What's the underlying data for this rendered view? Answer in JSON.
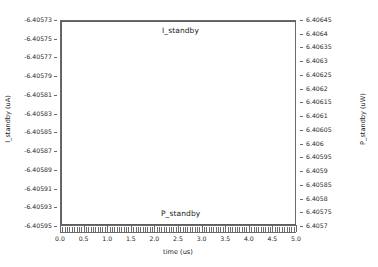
{
  "chart_data": {
    "type": "line",
    "title": "",
    "xlabel": "time (us)",
    "ylabel": "I_standby (uA)",
    "y2label": "P_standby (uW)",
    "grid": false,
    "legend": "in-plot annotations",
    "xlim": [
      0.0,
      5.0
    ],
    "xticks": [
      "0.0",
      "0.5",
      "1.0",
      "1.5",
      "2.0",
      "2.5",
      "3.0",
      "3.5",
      "4.0",
      "4.5",
      "5.0"
    ],
    "xtick_values": [
      0.0,
      0.5,
      1.0,
      1.5,
      2.0,
      2.5,
      3.0,
      3.5,
      4.0,
      4.5,
      5.0
    ],
    "xminor_per_major": 10,
    "ylim": [
      -6.40595,
      -6.40573
    ],
    "yticks": [
      "-6.40573",
      "-6.40575",
      "-6.40577",
      "-6.40579",
      "-6.40581",
      "-6.40583",
      "-6.40585",
      "-6.40587",
      "-6.40589",
      "-6.40591",
      "-6.40593",
      "-6.40595"
    ],
    "ytick_values": [
      -6.40573,
      -6.40575,
      -6.40577,
      -6.40579,
      -6.40581,
      -6.40583,
      -6.40585,
      -6.40587,
      -6.40589,
      -6.40591,
      -6.40593,
      -6.40595
    ],
    "y2lim": [
      6.4057,
      6.40645
    ],
    "y2ticks": [
      "6.40645",
      "6.4064",
      "6.40635",
      "6.4063",
      "6.40625",
      "6.4062",
      "6.40615",
      "6.4061",
      "6.40605",
      "6.406",
      "6.40595",
      "6.4059",
      "6.40585",
      "6.4058",
      "6.40575",
      "6.4057"
    ],
    "y2tick_values": [
      6.40645,
      6.4064,
      6.40635,
      6.4063,
      6.40625,
      6.4062,
      6.40615,
      6.4061,
      6.40605,
      6.406,
      6.40595,
      6.4059,
      6.40585,
      6.4058,
      6.40575,
      6.4057
    ],
    "series": [
      {
        "name": "I_standby",
        "axis": "left",
        "unit": "uA",
        "annotation": "I_standby",
        "x": [
          0.0,
          0.0,
          5.0
        ],
        "values": [
          -6.40595,
          -6.40573,
          -6.40573
        ],
        "color": "#5f5f5f"
      },
      {
        "name": "P_standby",
        "axis": "right",
        "unit": "uW",
        "annotation": "P_standby",
        "x": [
          0.0,
          5.0
        ],
        "values": [
          6.4057,
          6.4057
        ],
        "color": "#5f5f5f"
      }
    ]
  },
  "axes": {
    "left_label": "I_standby (uA)",
    "right_label": "P_standby (uW)",
    "x_label": "time (us)"
  },
  "annotations": {
    "top_series": "I_standby",
    "bottom_series": "P_standby"
  },
  "colors": {
    "trace": "#5f5f5f",
    "frame": "#6b6b6b",
    "text": "#1a1a1a",
    "background": "#ffffff"
  }
}
